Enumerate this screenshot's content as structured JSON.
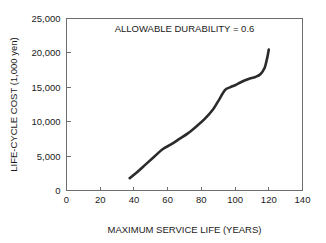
{
  "chart_data": {
    "type": "line",
    "title": "",
    "xlabel": "MAXIMUM SERVICE LIFE (YEARS)",
    "ylabel": "LIFE-CYCLE COST (1,000 yen)",
    "xlim": [
      0,
      140
    ],
    "ylim": [
      0,
      25000
    ],
    "grid": false,
    "legend": "none",
    "annotations": [
      {
        "text": "ALLOWABLE DURABILITY = 0.6",
        "x": 70,
        "y": 23000
      }
    ],
    "xticks": [
      0,
      20,
      40,
      60,
      80,
      100,
      120,
      140
    ],
    "xtick_labels": [
      "0",
      "20",
      "40",
      "60",
      "80",
      "100",
      "120",
      "140"
    ],
    "yticks": [
      0,
      5000,
      10000,
      15000,
      20000,
      25000
    ],
    "ytick_labels": [
      "0",
      "5,000",
      "10,000",
      "15,000",
      "20,000",
      "25,000"
    ],
    "series": [
      {
        "name": "life-cycle cost",
        "color": "#2b2b2b",
        "x": [
          37.5,
          42,
          47,
          52,
          57,
          62,
          67,
          72,
          77,
          82,
          87,
          91,
          94,
          97,
          100,
          104,
          108,
          112,
          115,
          117.5,
          119,
          120
        ],
        "y": [
          1800,
          2700,
          3800,
          4900,
          6000,
          6700,
          7500,
          8300,
          9300,
          10400,
          11800,
          13400,
          14600,
          15000,
          15300,
          15800,
          16200,
          16500,
          16900,
          17800,
          19200,
          20500
        ]
      }
    ]
  },
  "axes": {
    "x_title": "MAXIMUM SERVICE LIFE (YEARS)",
    "y_title": "LIFE-CYCLE COST (1,000 yen)"
  },
  "colors": {
    "curve": "#2b2b2b",
    "frame": "#6e6e6e",
    "text": "#1a1a1a",
    "background": "#ffffff"
  }
}
